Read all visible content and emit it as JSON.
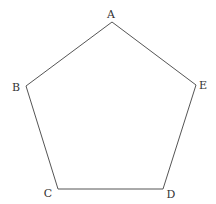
{
  "diagram": {
    "type": "polygon",
    "shape": "pentagon",
    "stroke_color": "#555555",
    "background": "#ffffff",
    "vertices": [
      {
        "label": "A",
        "x": 112,
        "y": 22,
        "label_x": 111,
        "label_y": 18
      },
      {
        "label": "B",
        "x": 26,
        "y": 86,
        "label_x": 16,
        "label_y": 91
      },
      {
        "label": "C",
        "x": 58,
        "y": 189,
        "label_x": 48,
        "label_y": 197
      },
      {
        "label": "D",
        "x": 163,
        "y": 189,
        "label_x": 171,
        "label_y": 198
      },
      {
        "label": "E",
        "x": 196,
        "y": 85,
        "label_x": 203,
        "label_y": 89
      }
    ],
    "edges": [
      [
        "A",
        "B"
      ],
      [
        "B",
        "C"
      ],
      [
        "C",
        "D"
      ],
      [
        "D",
        "E"
      ],
      [
        "E",
        "A"
      ]
    ]
  }
}
